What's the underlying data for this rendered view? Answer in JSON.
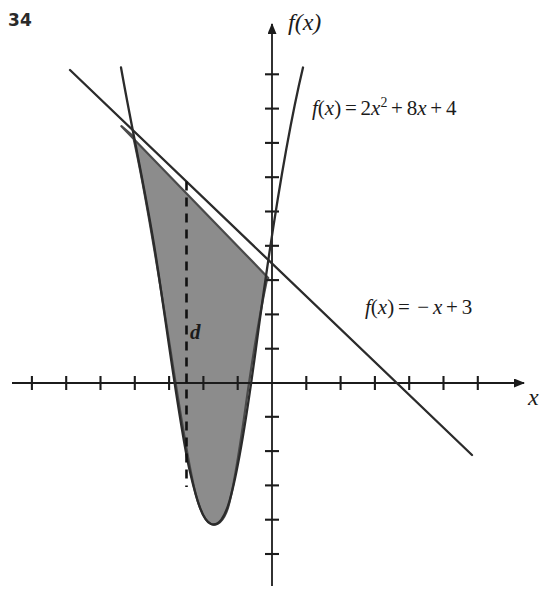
{
  "figure": {
    "problem_number": "34",
    "background_color": "#ffffff",
    "ink_color": "#1b1b1b",
    "shade_color": "#8c8c8c",
    "shade_stroke_color": "#4a4a4a"
  },
  "axes": {
    "x_label": "x",
    "y_label": "f(x)",
    "origin_px": {
      "x": 272,
      "y": 383
    },
    "unit_px": 34.3,
    "x_axis_line_px": {
      "x1": 12,
      "x2": 530,
      "y": 383
    },
    "y_axis_line_px": {
      "y1": 22,
      "y2": 586,
      "x": 272
    },
    "x_tick_units": [
      -7,
      -6,
      -5,
      -4,
      -3,
      -2,
      -1,
      1,
      2,
      3,
      4,
      5,
      6,
      7
    ],
    "y_tick_units": [
      -5,
      -4,
      -3,
      -2,
      -1,
      1,
      2,
      3,
      4,
      5,
      6,
      7,
      8,
      9,
      10
    ],
    "tick_half_length_px": 7,
    "grid": "off",
    "tick_labels_shown": "none",
    "arrowheads": [
      "x-positive",
      "y-positive"
    ]
  },
  "curves": {
    "quadratic": {
      "label_text": "f(x) = 2x2 + 8x + 4",
      "label_parts": {
        "fname": "f",
        "arg": "(x)",
        "equals": "=",
        "coef_a": "2",
        "var": "x",
        "power": "2",
        "plus1": "+",
        "coef_b": "8",
        "var2": "x",
        "plus2": "+",
        "const": "4"
      },
      "a": 2,
      "b": 8,
      "c": 4,
      "vertex": {
        "x": -2,
        "y": -4
      },
      "roots": [
        -3.41,
        -0.59
      ],
      "y_intercept": 4,
      "drawn_domain": [
        -4.4,
        0.9
      ]
    },
    "linear": {
      "label_text": "f(x) = -x + 3",
      "label_parts": {
        "fname": "f",
        "arg": "(x)",
        "equals": "=",
        "minus": "−",
        "var": "x",
        "plus": "+",
        "const": "3"
      },
      "slope": -1,
      "intercept": 3,
      "x_intercept": 3,
      "drawn_domain": [
        -5.9,
        5.8
      ]
    }
  },
  "region": {
    "name": "area-between-curves",
    "fill": "#8c8c8c",
    "bounded_left_x": -4.39,
    "bounded_right_x": -0.11,
    "description": "Region between the line and the parabola"
  },
  "annotations": {
    "distance_segment": {
      "label": "d",
      "style": "dashed",
      "at_x": -2.5,
      "from_y": -3.0,
      "to_y": 5.5
    }
  }
}
